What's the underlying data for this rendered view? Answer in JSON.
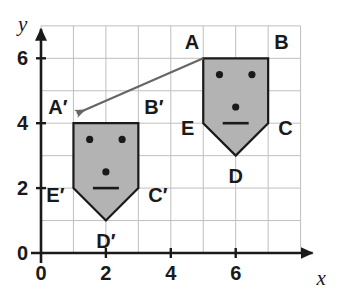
{
  "figure": {
    "axes": {
      "x_label": "x",
      "y_label": "y",
      "origin_label": "0",
      "x_ticks": [
        {
          "value": 0,
          "label": "0"
        },
        {
          "value": 2,
          "label": "2"
        },
        {
          "value": 4,
          "label": "4"
        },
        {
          "value": 6,
          "label": "6"
        }
      ],
      "y_ticks": [
        {
          "value": 0,
          "label": "0"
        },
        {
          "value": 2,
          "label": "2"
        },
        {
          "value": 4,
          "label": "4"
        },
        {
          "value": 6,
          "label": "6"
        }
      ],
      "x_range": [
        0,
        8
      ],
      "y_range": [
        0,
        7
      ],
      "grid": true,
      "grid_step": 1
    },
    "colors": {
      "shape_fill": "#b3b3b3",
      "shape_stroke": "#1a1a1a",
      "grid_line": "#bfbfbf",
      "axis": "#1a1a1a",
      "arrow": "#666666",
      "feature": "#1a1a1a",
      "background": "#ffffff"
    },
    "shapes": [
      {
        "id": "preimage",
        "name": "pentagon-ABCDE",
        "vertices": [
          {
            "label": "A",
            "x": 5,
            "y": 6
          },
          {
            "label": "B",
            "x": 7,
            "y": 6
          },
          {
            "label": "C",
            "x": 7,
            "y": 4
          },
          {
            "label": "D",
            "x": 6,
            "y": 3
          },
          {
            "label": "E",
            "x": 5,
            "y": 4
          }
        ],
        "features": {
          "eyes": [
            {
              "x": 5.5,
              "y": 5.5
            },
            {
              "x": 6.5,
              "y": 5.5
            }
          ],
          "nose": {
            "x": 6,
            "y": 4.5
          },
          "mouth": {
            "x1": 5.6,
            "x2": 6.4,
            "y": 4
          }
        }
      },
      {
        "id": "image",
        "name": "pentagon-ABCDE-prime",
        "vertices": [
          {
            "label": "A′",
            "x": 1,
            "y": 4
          },
          {
            "label": "B′",
            "x": 3,
            "y": 4
          },
          {
            "label": "C′",
            "x": 3,
            "y": 2
          },
          {
            "label": "D′",
            "x": 2,
            "y": 1
          },
          {
            "label": "E′",
            "x": 1,
            "y": 2
          }
        ],
        "features": {
          "eyes": [
            {
              "x": 1.5,
              "y": 3.5
            },
            {
              "x": 2.5,
              "y": 3.5
            }
          ],
          "nose": {
            "x": 2,
            "y": 2.5
          },
          "mouth": {
            "x1": 1.6,
            "x2": 2.4,
            "y": 2
          }
        }
      }
    ],
    "arrow": {
      "name": "translation-arrow",
      "from": {
        "x": 5,
        "y": 6
      },
      "to": {
        "x": 1.1,
        "y": 4.3
      }
    }
  }
}
